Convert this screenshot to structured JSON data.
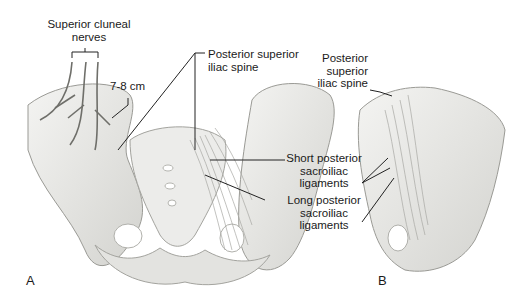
{
  "figure": {
    "panels": [
      {
        "id": "A",
        "label": "A"
      },
      {
        "id": "B",
        "label": "B"
      }
    ],
    "labels": {
      "superior_cluneal_nerves": [
        "Superior cluneal",
        "nerves"
      ],
      "distance": "7-8 cm",
      "psis_a": [
        "Posterior superior",
        "iliac spine"
      ],
      "short_ligaments": [
        "Short posterior",
        "sacroiliac",
        "ligaments"
      ],
      "long_ligaments": [
        "Long posterior",
        "sacroiliac",
        "ligaments"
      ],
      "psis_b": [
        "Posterior",
        "superior",
        "iliac spine"
      ]
    },
    "colors": {
      "bone": "#e9e9e6",
      "bone_shadow": "#c9c9c5",
      "outline": "#8f8f8a",
      "leader_line": "#222222",
      "text": "#1a1a1a"
    }
  }
}
